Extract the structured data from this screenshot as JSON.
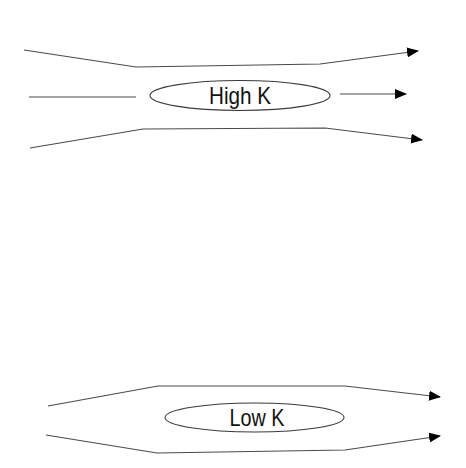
{
  "diagrams": [
    {
      "name": "high-k",
      "label": "High K",
      "streamlines": [
        {
          "id": "top",
          "points": [
            [
              24,
              50
            ],
            [
              136,
              67
            ],
            [
              320,
              64
            ],
            [
              418,
              51
            ]
          ]
        },
        {
          "id": "middle-in",
          "points": [
            [
              29,
              97
            ],
            [
              136,
              97
            ]
          ]
        },
        {
          "id": "middle-out",
          "points": [
            [
              340,
              94
            ],
            [
              406,
              94
            ]
          ]
        },
        {
          "id": "bottom",
          "points": [
            [
              30,
              148
            ],
            [
              143,
              129
            ],
            [
              325,
              128
            ],
            [
              422,
              140
            ]
          ]
        }
      ]
    },
    {
      "name": "low-k",
      "label": "Low K",
      "streamlines": [
        {
          "id": "top",
          "points": [
            [
              48,
              406
            ],
            [
              158,
              386
            ],
            [
              345,
              386
            ],
            [
              440,
              397
            ]
          ]
        },
        {
          "id": "bottom",
          "points": [
            [
              46,
              435
            ],
            [
              157,
              453
            ],
            [
              345,
              450
            ],
            [
              440,
              436
            ]
          ]
        }
      ]
    }
  ],
  "colors": {
    "line": "#4a4a4a",
    "arrow": "#000000",
    "text": "#111111",
    "background": "#ffffff"
  }
}
